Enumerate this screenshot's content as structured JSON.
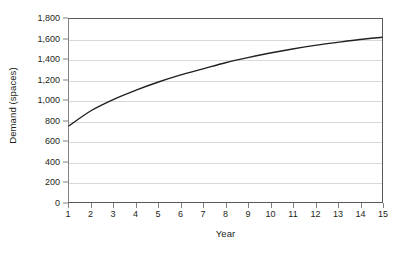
{
  "chart_data": {
    "type": "line",
    "title": "",
    "xlabel": "Year",
    "ylabel": "Demand (spaces)",
    "xlim": [
      1,
      15
    ],
    "ylim": [
      0,
      1800
    ],
    "grid": true,
    "legend": "none",
    "line_color": "#231f20",
    "grid_color": "#d9d9d9",
    "axis_color": "#58595b",
    "background_color": "#ffffff",
    "x": [
      1,
      2,
      3,
      4,
      5,
      6,
      7,
      8,
      9,
      10,
      11,
      12,
      13,
      14,
      15
    ],
    "xtick_labels": [
      "1",
      "2",
      "3",
      "4",
      "5",
      "6",
      "7",
      "8",
      "9",
      "10",
      "11",
      "12",
      "13",
      "14",
      "15"
    ],
    "ytick_values": [
      0,
      200,
      400,
      600,
      800,
      1000,
      1200,
      1400,
      1600,
      1800
    ],
    "ytick_labels": [
      "0",
      "200",
      "400",
      "600",
      "800",
      "1,000",
      "1,200",
      "1,400",
      "1,600",
      "1,800"
    ],
    "series": [
      {
        "name": "Demand",
        "values": [
          750,
          900,
          1010,
          1100,
          1180,
          1250,
          1310,
          1370,
          1420,
          1465,
          1505,
          1540,
          1570,
          1598,
          1620
        ]
      }
    ]
  }
}
